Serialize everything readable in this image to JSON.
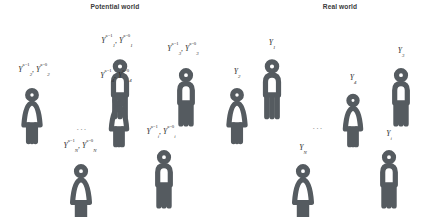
{
  "panels": [
    {
      "id": "potential-world",
      "title": "Potential world",
      "title_x": 115,
      "title_y": 3,
      "ellipsis": {
        "text": "...",
        "x": 82,
        "y": 122
      },
      "people": [
        {
          "id": "subject-1",
          "sex": "male",
          "x": 120,
          "y": 59,
          "scale": 1.0,
          "label": {
            "symbol": "Y",
            "sub": "1",
            "sup_a": "a=1",
            "sup_b": "a=0",
            "sep": ", ",
            "x": 117,
            "y": 37
          }
        },
        {
          "id": "subject-2",
          "sex": "female",
          "x": 32,
          "y": 88,
          "scale": 0.93,
          "label": {
            "symbol": "Y",
            "sub": "2",
            "sup_a": "a=1",
            "sup_b": "a=0",
            "sep": ", ",
            "x": 34,
            "y": 66
          }
        },
        {
          "id": "subject-3",
          "sex": "male",
          "x": 186,
          "y": 68,
          "scale": 0.97,
          "label": {
            "symbol": "Y",
            "sub": "3",
            "sup_a": "a=1",
            "sup_b": "a=0",
            "sep": ", ",
            "x": 183,
            "y": 45
          }
        },
        {
          "id": "subject-4",
          "sex": "female",
          "x": 119,
          "y": 94,
          "scale": 0.88,
          "label": {
            "symbol": "Y",
            "sub": "4",
            "sup_a": "a=1",
            "sup_b": "a=0",
            "sep": ", ",
            "x": 116,
            "y": 72
          }
        },
        {
          "id": "subject-i",
          "sex": "male",
          "x": 164,
          "y": 150,
          "scale": 0.97,
          "label": {
            "symbol": "Y",
            "sub": "i",
            "sup_a": "a=1",
            "sup_b": "a=0",
            "sep": ", ",
            "x": 161,
            "y": 128
          }
        },
        {
          "id": "subject-n",
          "sex": "female",
          "x": 81,
          "y": 164,
          "scale": 0.97,
          "label": {
            "symbol": "Y",
            "sub": "N",
            "sup_a": "a=1",
            "sup_b": "a=0",
            "sep": ", ",
            "x": 80,
            "y": 142
          }
        }
      ]
    },
    {
      "id": "real-world",
      "title": "Real world",
      "title_x": 340,
      "title_y": 3,
      "ellipsis": {
        "text": "...",
        "x": 318,
        "y": 121
      },
      "people": [
        {
          "id": "subject-1",
          "sex": "male",
          "x": 272,
          "y": 59,
          "scale": 1.0,
          "label": {
            "symbol": "Y",
            "sub": "1",
            "x": 272,
            "y": 39
          }
        },
        {
          "id": "subject-2",
          "sex": "female",
          "x": 237,
          "y": 88,
          "scale": 0.93,
          "label": {
            "symbol": "Y",
            "sub": "2",
            "x": 237,
            "y": 68
          }
        },
        {
          "id": "subject-3",
          "sex": "male",
          "x": 401,
          "y": 68,
          "scale": 0.97,
          "label": {
            "symbol": "Y",
            "sub": "3",
            "x": 401,
            "y": 47
          }
        },
        {
          "id": "subject-4",
          "sex": "female",
          "x": 353,
          "y": 94,
          "scale": 0.88,
          "label": {
            "symbol": "Y",
            "sub": "4",
            "x": 353,
            "y": 74
          }
        },
        {
          "id": "subject-i",
          "sex": "male",
          "x": 389,
          "y": 150,
          "scale": 0.97,
          "label": {
            "symbol": "Y",
            "sub": "i",
            "x": 389,
            "y": 130
          }
        },
        {
          "id": "subject-n",
          "sex": "female",
          "x": 303,
          "y": 164,
          "scale": 0.97,
          "label": {
            "symbol": "Y",
            "sub": "N",
            "x": 303,
            "y": 144
          }
        }
      ]
    }
  ],
  "style": {
    "stroke_color": "#555b60",
    "label_color": "#2e2e2e",
    "title_color": "#3a3a3a",
    "background": "#ffffff"
  }
}
